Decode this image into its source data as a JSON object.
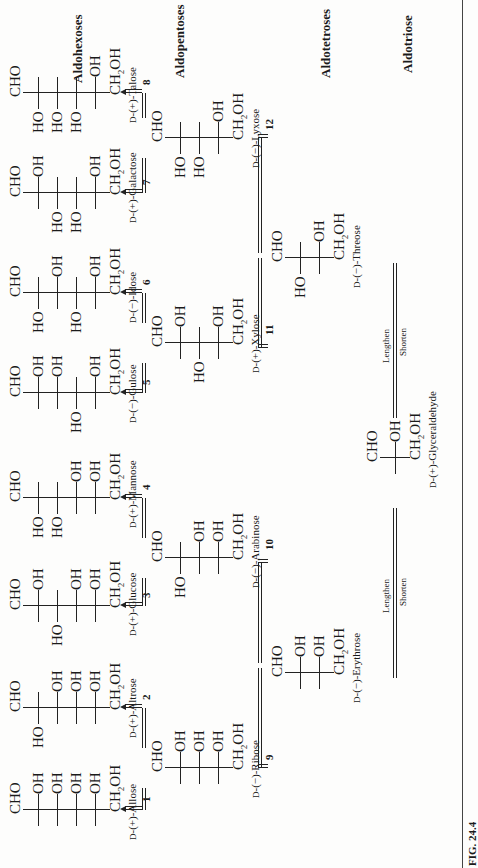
{
  "figure": {
    "caption": "FIG. 24.4",
    "series_labels": {
      "aldohexoses": "Aldohexoses",
      "aldopentoses": "Aldopentoses",
      "aldotetroses": "Aldotetroses",
      "aldotriose": "Aldotriose"
    },
    "arrow_labels": {
      "lengthen": "Lengthen",
      "shorten": "Shorten"
    },
    "groups": {
      "top": "CHO",
      "bottom_main": "CH",
      "bottom_sub": "2",
      "bottom_end": "OH",
      "oh": "OH",
      "ho": "HO"
    },
    "molecules": [
      {
        "id": "allose",
        "name": "D-(+)-Allose",
        "prefix": "D",
        "rest": "-(+)-Allose",
        "number": "1",
        "class": "aldohexose",
        "sides": [
          "R",
          "R",
          "R",
          "R"
        ]
      },
      {
        "id": "altrose",
        "name": "D-(+)-Altrose",
        "prefix": "D",
        "rest": "-(+)-Altrose",
        "number": "2",
        "class": "aldohexose",
        "sides": [
          "L",
          "R",
          "R",
          "R"
        ]
      },
      {
        "id": "glucose",
        "name": "D-(+)-Glucose",
        "prefix": "D",
        "rest": "-(+)-Glucose",
        "number": "3",
        "class": "aldohexose",
        "sides": [
          "R",
          "L",
          "R",
          "R"
        ]
      },
      {
        "id": "mannose",
        "name": "D-(+)-Mannose",
        "prefix": "D",
        "rest": "-(+)-Mannose",
        "number": "4",
        "class": "aldohexose",
        "sides": [
          "L",
          "L",
          "R",
          "R"
        ]
      },
      {
        "id": "gulose",
        "name": "D-(−)-Gulose",
        "prefix": "D",
        "rest": "-(−)-Gulose",
        "number": "5",
        "class": "aldohexose",
        "sides": [
          "R",
          "R",
          "L",
          "R"
        ]
      },
      {
        "id": "idose",
        "name": "D-(−)-Idose",
        "prefix": "D",
        "rest": "-(−)-Idose",
        "number": "6",
        "class": "aldohexose",
        "sides": [
          "L",
          "R",
          "L",
          "R"
        ]
      },
      {
        "id": "galactose",
        "name": "D-(+)-Galactose",
        "prefix": "D",
        "rest": "-(+)-Galactose",
        "number": "7",
        "class": "aldohexose",
        "sides": [
          "R",
          "L",
          "L",
          "R"
        ]
      },
      {
        "id": "talose",
        "name": "D-(+)-Talose",
        "prefix": "D",
        "rest": "-(+)-Talose",
        "number": "8",
        "class": "aldohexose",
        "sides": [
          "L",
          "L",
          "L",
          "R"
        ]
      },
      {
        "id": "ribose",
        "name": "D-(−)-Ribose",
        "prefix": "D",
        "rest": "-(−)-Ribose",
        "number": "9",
        "class": "aldopentose",
        "sides": [
          "R",
          "R",
          "R"
        ]
      },
      {
        "id": "arabinose",
        "name": "D-(−)-Arabinose",
        "prefix": "D",
        "rest": "-(−)-Arabinose",
        "number": "10",
        "class": "aldopentose",
        "sides": [
          "L",
          "R",
          "R"
        ]
      },
      {
        "id": "xylose",
        "name": "D-(+)-Xylose",
        "prefix": "D",
        "rest": "-(+)-Xylose",
        "number": "11",
        "class": "aldopentose",
        "sides": [
          "R",
          "L",
          "R"
        ]
      },
      {
        "id": "lyxose",
        "name": "D-(−)-Lyxose",
        "prefix": "D",
        "rest": "-(−)-Lyxose",
        "number": "12",
        "class": "aldopentose",
        "sides": [
          "L",
          "L",
          "R"
        ]
      },
      {
        "id": "erythrose",
        "name": "D-(−)-Erythrose",
        "prefix": "D",
        "rest": "-(−)-Erythrose",
        "number": "",
        "class": "aldotetrose",
        "sides": [
          "R",
          "R"
        ]
      },
      {
        "id": "threose",
        "name": "D-(−)-Threose",
        "prefix": "D",
        "rest": "-(−)-Threose",
        "number": "",
        "class": "aldotetrose",
        "sides": [
          "L",
          "R"
        ]
      },
      {
        "id": "glyceraldehyde",
        "name": "D-(+)-Glyceraldehyde",
        "prefix": "D",
        "rest": "-(+)-Glyceraldehyde",
        "number": "",
        "class": "aldotriose",
        "sides": [
          "R"
        ]
      }
    ]
  }
}
